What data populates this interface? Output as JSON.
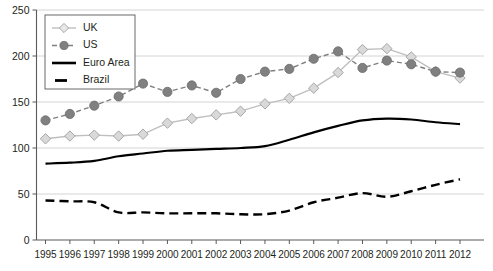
{
  "chart_data": {
    "type": "line",
    "title": "",
    "subtitle": "",
    "xlabel": "",
    "ylabel": "",
    "categories": [
      "1995",
      "1996",
      "1997",
      "1998",
      "1999",
      "2000",
      "2001",
      "2002",
      "2003",
      "2004",
      "2005",
      "2006",
      "2007",
      "2008",
      "2009",
      "2010",
      "2011",
      "2012"
    ],
    "x_tick_labels": [
      "1995",
      "1996",
      "1997",
      "1998",
      "1999",
      "2000",
      "2001",
      "2002",
      "2003",
      "2004",
      "2005",
      "2006",
      "2007",
      "2008",
      "2009",
      "2010",
      "2011",
      "2012"
    ],
    "y_tick_labels": [
      "0",
      "50",
      "100",
      "150",
      "200",
      "250"
    ],
    "y_ticks": [
      0,
      50,
      100,
      150,
      200,
      250
    ],
    "ylim": [
      0,
      250
    ],
    "grid": "horizontal",
    "legend_position": "top-left",
    "series": [
      {
        "name": "UK",
        "color": "#bfbfbf",
        "marker": "diamond-open",
        "linestyle": "solid",
        "values": [
          110,
          113,
          114,
          113,
          115,
          127,
          132,
          136,
          140,
          148,
          154,
          165,
          182,
          207,
          208,
          199,
          183,
          176
        ]
      },
      {
        "name": "US",
        "color": "#808080",
        "marker": "circle-filled",
        "linestyle": "dashed",
        "values": [
          130,
          137,
          146,
          156,
          170,
          161,
          168,
          160,
          175,
          183,
          186,
          197,
          205,
          187,
          195,
          191,
          183,
          182
        ]
      },
      {
        "name": "Euro Area",
        "color": "#000000",
        "marker": "none",
        "linestyle": "solid",
        "values": [
          83,
          84,
          86,
          91,
          94,
          97,
          98,
          99,
          100,
          102,
          109,
          117,
          124,
          130,
          132,
          131,
          128,
          126
        ]
      },
      {
        "name": "Brazil",
        "color": "#000000",
        "marker": "none",
        "linestyle": "dashed",
        "values": [
          43,
          42,
          41,
          30,
          30,
          29,
          29,
          29,
          28,
          28,
          32,
          41,
          46,
          51,
          47,
          53,
          60,
          66
        ]
      }
    ]
  },
  "legend": {
    "items": [
      {
        "label": "UK"
      },
      {
        "label": "US"
      },
      {
        "label": "Euro Area"
      },
      {
        "label": "Brazil"
      }
    ]
  }
}
